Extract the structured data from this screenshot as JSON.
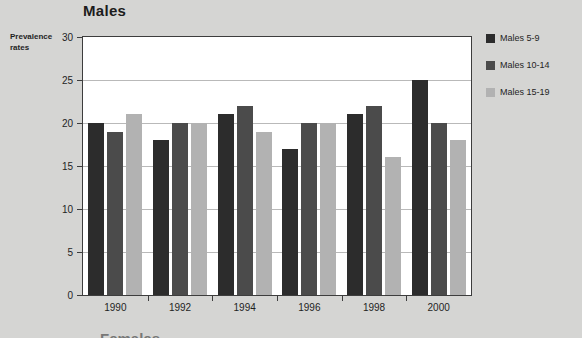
{
  "chart_data": {
    "type": "bar",
    "title": "Males",
    "xlabel": "",
    "ylabel": "Prevalence rates",
    "categories": [
      "1990",
      "1992",
      "1994",
      "1996",
      "1998",
      "2000"
    ],
    "series": [
      {
        "name": "Males  5-9",
        "color": "#2c2c2c",
        "values": [
          20,
          18,
          21,
          17,
          21,
          25
        ]
      },
      {
        "name": "Males 10-14",
        "color": "#4b4b4b",
        "values": [
          19,
          20,
          22,
          20,
          22,
          20
        ]
      },
      {
        "name": "Males 15-19",
        "color": "#b2b2b2",
        "values": [
          21,
          20,
          19,
          20,
          16,
          18
        ]
      }
    ],
    "ylim": [
      0,
      30
    ],
    "yticks": [
      0,
      5,
      10,
      15,
      20,
      25,
      30
    ],
    "ytick_labels": [
      "0",
      "5",
      "10",
      "15",
      "20",
      "25",
      "30"
    ],
    "grid": true,
    "legend_position": "right"
  },
  "axis": {
    "y_caption_line1": "Prevalence",
    "y_caption_line2": "rates"
  },
  "footer": {
    "next_chart_title_partial": "Females"
  },
  "colors": {
    "background": "#d5d5d3",
    "plot_background": "#ffffff",
    "plot_border": "#3d3d3d",
    "gridline": "#b9b9b9",
    "text": "#1f1f1f"
  }
}
